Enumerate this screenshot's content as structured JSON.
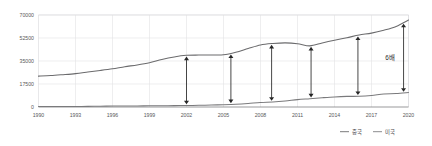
{
  "chart_data": {
    "type": "line",
    "title": "",
    "xlabel": "",
    "ylabel": "",
    "xlim": [
      1990,
      2020
    ],
    "ylim": [
      0,
      70000
    ],
    "yticks": [
      0,
      17500,
      35000,
      52500,
      70000
    ],
    "ytick_labels": [
      "0",
      "17500",
      "35000",
      "52500",
      "70000"
    ],
    "xticks": [
      1990,
      1993,
      1996,
      1999,
      2002,
      2005,
      2008,
      2011,
      2014,
      2017,
      2020
    ],
    "xtick_labels": [
      "1990",
      "1993",
      "1996",
      "1999",
      "2002",
      "2005",
      "2008",
      "2011",
      "2014",
      "2017",
      "2020"
    ],
    "grid": true,
    "legend_position": "bottom-right",
    "x": [
      1990,
      1991,
      1992,
      1993,
      1994,
      1995,
      1996,
      1997,
      1998,
      1999,
      2000,
      2001,
      2002,
      2003,
      2004,
      2005,
      2006,
      2007,
      2008,
      2009,
      2010,
      2011,
      2012,
      2013,
      2014,
      2015,
      2016,
      2017,
      2018,
      2019,
      2020
    ],
    "series": [
      {
        "name": "미국",
        "color": "#6b6b6d",
        "values": [
          23500,
          23900,
          24600,
          25400,
          26600,
          27800,
          29100,
          30700,
          32000,
          33700,
          36200,
          38100,
          39300,
          39500,
          39600,
          39700,
          41600,
          44500,
          47200,
          48300,
          48800,
          48200,
          46500,
          48700,
          50800,
          52700,
          54800,
          56200,
          58400,
          61300,
          66200
        ]
      },
      {
        "name": "중국",
        "color": "#7a7a7c",
        "values": [
          340,
          360,
          400,
          430,
          480,
          600,
          700,
          780,
          830,
          880,
          960,
          1050,
          1150,
          1290,
          1500,
          1750,
          2100,
          2700,
          3480,
          3830,
          4550,
          5620,
          6320,
          7050,
          7680,
          8070,
          8150,
          8760,
          9900,
          10200,
          11000
        ]
      }
    ],
    "annotations": [
      {
        "label": "",
        "x": 2002.0
      },
      {
        "label": "",
        "x": 2005.6
      },
      {
        "label": "",
        "x": 2008.9
      },
      {
        "label": "",
        "x": 2012.1
      },
      {
        "label": "",
        "x": 2015.9
      },
      {
        "label": "6배",
        "x": 2019.6
      }
    ],
    "gap_label": "6배"
  },
  "legend": {
    "items": [
      {
        "label": "중국",
        "color": "#7a7a7c"
      },
      {
        "label": "미국",
        "color": "#8c8c8e"
      }
    ]
  }
}
